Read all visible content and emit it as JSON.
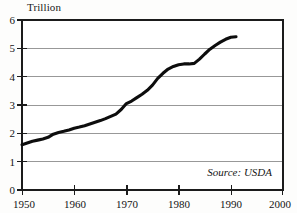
{
  "chart_data": {
    "type": "line",
    "title": "",
    "subtitle": "",
    "xlabel": "",
    "ylabel": "Trillion",
    "ylim": [
      0,
      6
    ],
    "xlim": [
      1950,
      2000
    ],
    "grid": true,
    "legend": null,
    "yticks": [
      0,
      1,
      2,
      3,
      4,
      5,
      6
    ],
    "ytick_labels": [
      "0",
      "1",
      "2",
      "3",
      "4",
      "5",
      "6"
    ],
    "xticks": [
      1950,
      1960,
      1970,
      1980,
      1990,
      2000
    ],
    "xtick_labels": [
      "1950",
      "1960",
      "1970",
      "1980",
      "1990",
      "2000"
    ],
    "annotations": [
      {
        "text": "Source: USDA",
        "position": "bottom-right-inside-plot",
        "style": "italic"
      }
    ],
    "series": [
      {
        "name": "Trillion",
        "x": [
          1950,
          1951,
          1952,
          1953,
          1954,
          1955,
          1956,
          1957,
          1958,
          1959,
          1960,
          1961,
          1962,
          1963,
          1964,
          1965,
          1966,
          1967,
          1968,
          1969,
          1970,
          1971,
          1972,
          1973,
          1974,
          1975,
          1976,
          1977,
          1978,
          1979,
          1980,
          1981,
          1982,
          1983,
          1984,
          1985,
          1986,
          1987,
          1988,
          1989,
          1990,
          1991
        ],
        "values": [
          1.6,
          1.66,
          1.72,
          1.76,
          1.8,
          1.86,
          1.97,
          2.03,
          2.07,
          2.12,
          2.18,
          2.22,
          2.27,
          2.33,
          2.39,
          2.45,
          2.52,
          2.6,
          2.68,
          2.84,
          3.05,
          3.14,
          3.26,
          3.38,
          3.52,
          3.7,
          3.94,
          4.12,
          4.27,
          4.36,
          4.42,
          4.45,
          4.45,
          4.47,
          4.62,
          4.8,
          4.97,
          5.1,
          5.22,
          5.32,
          5.39,
          5.41
        ]
      }
    ]
  },
  "axis_caption": {
    "y_unit": "Trillion"
  },
  "source": {
    "label": "Source: USDA"
  }
}
